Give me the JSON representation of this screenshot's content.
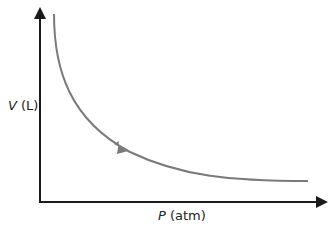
{
  "diagram": {
    "title": "",
    "y_axis": {
      "variable": "V",
      "unit": "(L)"
    },
    "x_axis": {
      "variable": "P",
      "unit": "(atm)"
    },
    "curve": {
      "description": "Inverse relationship between pressure and volume (Boyle's law)",
      "color": "#7a7a7a",
      "direction": "decreasing V with increasing P"
    },
    "axis_color": "#1a1a1a"
  }
}
